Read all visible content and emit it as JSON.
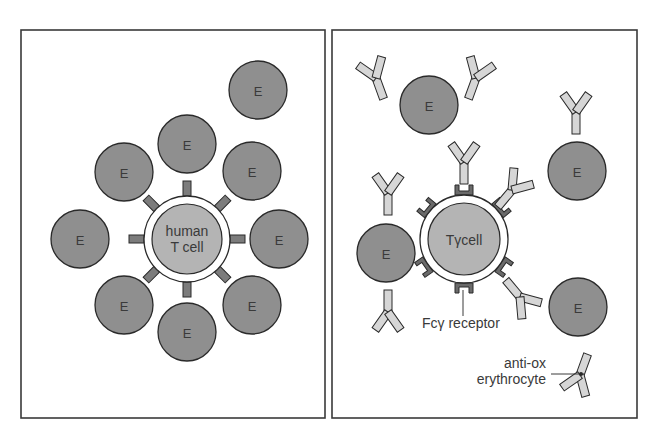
{
  "diagram": {
    "type": "immunology-illustration",
    "panels": [
      {
        "id": "left",
        "title": "",
        "center_cell": {
          "label_line1": "human",
          "label_line2": "T cell"
        },
        "erythrocyte_label": "E",
        "erythrocyte_count": 9,
        "receptor_count": 8
      },
      {
        "id": "right",
        "title": "",
        "center_cell": {
          "label": "Tγcell"
        },
        "erythrocyte_label": "E",
        "erythrocyte_count": 4,
        "annotations": {
          "fc_receptor": "Fcγ receptor",
          "antibody_line1": "anti-ox",
          "antibody_line2": "erythrocyte"
        }
      }
    ],
    "colors": {
      "erythrocyte": "#8f8f8f",
      "t_cell_inner": "#b4b4b4",
      "antibody": "#d6d6d6",
      "receptor": "#7c7c7c",
      "outline": "#2a2a2a"
    }
  }
}
